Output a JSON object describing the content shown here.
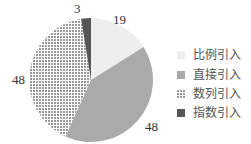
{
  "chart_data": {
    "type": "pie",
    "title": "",
    "start_angle": "12 o'clock, clockwise",
    "slices": [
      {
        "label": "比例引入",
        "value": 19,
        "color": "#eeeeee",
        "pattern": "solid"
      },
      {
        "label": "直接引入",
        "value": 48,
        "color": "#aaaaaa",
        "pattern": "solid"
      },
      {
        "label": "数列引入",
        "value": 48,
        "color": "#bdbdbd",
        "pattern": "dots"
      },
      {
        "label": "指数引入",
        "value": 3,
        "color": "#555555",
        "pattern": "solid"
      }
    ],
    "legend_position": "right"
  },
  "legend": [
    "比例引入",
    "直接引入",
    "数列引入",
    "指数引入"
  ],
  "data_labels": [
    "19",
    "48",
    "48",
    "3"
  ]
}
